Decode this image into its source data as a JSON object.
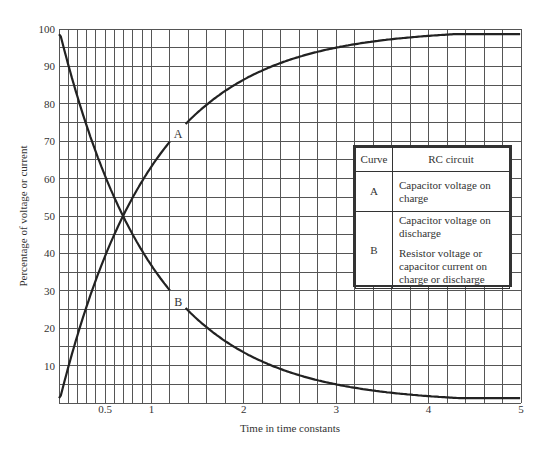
{
  "chart_data": {
    "type": "line",
    "title": "",
    "xlabel": "Time in time constants",
    "ylabel": "Percentage of voltage or current",
    "xlim": [
      0,
      5
    ],
    "ylim": [
      0,
      100
    ],
    "x_ticks": [
      {
        "value": 0.5,
        "label": "0.5"
      },
      {
        "value": 1,
        "label": "1"
      },
      {
        "value": 2,
        "label": "2"
      },
      {
        "value": 3,
        "label": "3"
      },
      {
        "value": 4,
        "label": "4"
      },
      {
        "value": 5,
        "label": "5"
      }
    ],
    "y_ticks": [
      {
        "value": 10,
        "label": "10"
      },
      {
        "value": 20,
        "label": "20"
      },
      {
        "value": 30,
        "label": "30"
      },
      {
        "value": 40,
        "label": "40"
      },
      {
        "value": 50,
        "label": "50"
      },
      {
        "value": 60,
        "label": "60"
      },
      {
        "value": 70,
        "label": "70"
      },
      {
        "value": 80,
        "label": "80"
      },
      {
        "value": 90,
        "label": "90"
      },
      {
        "value": 100,
        "label": "100"
      }
    ],
    "grid": {
      "on": true,
      "x_minor_fine": {
        "from": 0,
        "to": 1,
        "step": 0.1
      },
      "x_minor_coarse": {
        "from": 1,
        "to": 5,
        "step": 0.2
      },
      "y_step": 5
    },
    "x": [
      0,
      0.5,
      0.7,
      1,
      1.2,
      1.5,
      2,
      2.5,
      3,
      3.5,
      4,
      4.5,
      5
    ],
    "series": [
      {
        "name": "A",
        "values": [
          0,
          39.3,
          50.3,
          63.2,
          69.9,
          77.7,
          86.5,
          91.8,
          95.0,
          97.0,
          98.2,
          98.9,
          99.3
        ]
      },
      {
        "name": "B",
        "values": [
          100,
          60.7,
          49.7,
          36.8,
          30.1,
          22.3,
          13.5,
          8.2,
          5.0,
          3.0,
          1.8,
          1.1,
          0.7
        ]
      }
    ],
    "annotations": [
      {
        "text": "A",
        "x": 1.29,
        "y": 72
      },
      {
        "text": "B",
        "x": 1.29,
        "y": 27
      }
    ],
    "legend": {
      "position": "right-center",
      "headers": [
        "Curve",
        "RC circuit"
      ],
      "rows": [
        {
          "curve": "A",
          "descriptions": [
            "Capacitor voltage on charge"
          ]
        },
        {
          "curve": "B",
          "descriptions": [
            "Capacitor voltage on discharge",
            "Resistor voltage or capacitor current on charge or discharge"
          ]
        }
      ]
    }
  },
  "legend_table": {
    "header_curve": "Curve",
    "header_circuit": "RC circuit",
    "row_a_curve": "A",
    "row_a_desc": "Capacitor voltage on charge",
    "row_b_curve": "B",
    "row_b_desc_1": "Capacitor voltage on discharge",
    "row_b_desc_2": "Resistor voltage or capacitor current on charge or discharge"
  },
  "style": {
    "grid_color": "#555555",
    "curve_color": "#222222",
    "text_color": "#333333"
  }
}
